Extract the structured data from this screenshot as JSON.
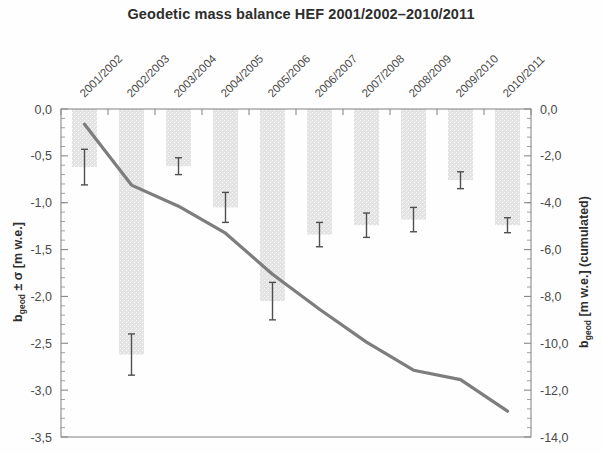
{
  "chart_data": {
    "type": "bar",
    "title": "Geodetic mass balance HEF 2001/2002–2010/2011",
    "xlabel": "",
    "ylabel": "b_geod ± σ [m w.e.]",
    "ylabel_right": "b_geod [m w.e.] (cumulated)",
    "ylabel_main_text": "± σ [m w.e.]",
    "ylabel_main_prefix": "b",
    "ylabel_main_sub": "geod",
    "ylabel_right_prefix": "b",
    "ylabel_right_sub": "geod",
    "ylabel_right_text": " [m w.e.] (cumulated)",
    "categories": [
      "2001/2002",
      "2002/2003",
      "2003/2004",
      "2004/2005",
      "2005/2006",
      "2006/2007",
      "2007/2008",
      "2008/2009",
      "2009/2010",
      "2010/2011"
    ],
    "values": [
      -0.62,
      -2.62,
      -0.61,
      -1.05,
      -2.05,
      -1.34,
      -1.24,
      -1.18,
      -0.76,
      -1.24
    ],
    "errors": [
      0.19,
      0.22,
      0.09,
      0.16,
      0.2,
      0.13,
      0.13,
      0.13,
      0.09,
      0.08
    ],
    "series": [
      {
        "name": "b_geod ± σ (annual)",
        "type": "bar",
        "values": [
          -0.62,
          -2.62,
          -0.61,
          -1.05,
          -2.05,
          -1.34,
          -1.24,
          -1.18,
          -0.76,
          -1.24
        ]
      },
      {
        "name": "b_geod (cumulated)",
        "type": "line",
        "axis": "right",
        "x": [
          "2001/2002",
          "2002/2003",
          "2003/2004",
          "2004/2005",
          "2005/2006",
          "2006/2007",
          "2007/2008",
          "2008/2009",
          "2009/2010",
          "2010/2011"
        ],
        "values": [
          -0.65,
          -3.25,
          -4.15,
          -5.3,
          -7.05,
          -8.55,
          -9.95,
          -11.15,
          -11.55,
          -12.9
        ]
      }
    ],
    "ylim": [
      -3.5,
      0.0
    ],
    "ylim_right": [
      -14.0,
      0.0
    ],
    "yticks": [
      "0,0",
      "-0,5",
      "-1,0",
      "-1,5",
      "-2,0",
      "-2,5",
      "-3,0",
      "-3,5"
    ],
    "ytick_values": [
      0.0,
      -0.5,
      -1.0,
      -1.5,
      -2.0,
      -2.5,
      -3.0,
      -3.5
    ],
    "yticks_right": [
      "0,0",
      "-2,0",
      "-4,0",
      "-6,0",
      "-8,0",
      "-10,0",
      "-12,0",
      "-14,0"
    ],
    "ytick_values_right": [
      0.0,
      -2.0,
      -4.0,
      -6.0,
      -8.0,
      -10.0,
      -12.0,
      -14.0
    ],
    "grid": false,
    "legend": "none",
    "bar_color": "#e3e3e3",
    "line_color": "#7d7d7d",
    "error_color": "#4f4f4f",
    "axis_color": "#8a8a8a"
  }
}
